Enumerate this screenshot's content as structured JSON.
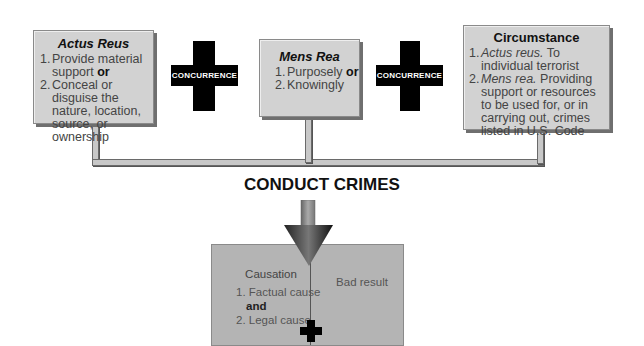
{
  "boxes": {
    "actus_reus": {
      "title": "Actus Reus",
      "items": [
        {
          "num": "1.",
          "text": "Provide material support",
          "conj": "or"
        },
        {
          "num": "2.",
          "text": "Conceal or disguise the nature, location, source, or ownership"
        }
      ]
    },
    "mens_rea": {
      "title": "Mens Rea",
      "items": [
        {
          "num": "1.",
          "text": "Purposely",
          "conj": "or"
        },
        {
          "num": "2.",
          "text": "Knowingly"
        }
      ]
    },
    "circumstance": {
      "title": "Circumstance",
      "items": [
        {
          "num": "1.",
          "lead": "Actus reus.",
          "text": "To individual terrorist"
        },
        {
          "num": "2.",
          "lead": "Mens rea.",
          "text": "Providing support or resources to be used for, or in carrying out, crimes listed in U.S. Code"
        }
      ]
    }
  },
  "connectors": {
    "left": "CONCURRENCE",
    "right": "CONCURRENCE"
  },
  "main_label": "CONDUCT CRIMES",
  "result": {
    "causation_title": "Causation",
    "items": [
      {
        "num": "1.",
        "text": "Factual cause"
      },
      {
        "conj": "and"
      },
      {
        "num": "2.",
        "text": "Legal cause"
      }
    ],
    "bad_result": "Bad result"
  },
  "colors": {
    "box_fill": "#d2d2d2",
    "cross": "#000000",
    "bottom_fill": "#b4b4b4"
  }
}
